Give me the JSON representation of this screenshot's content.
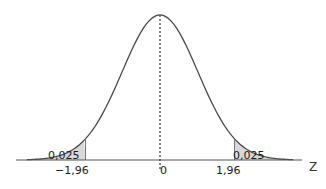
{
  "chart_data": {
    "type": "area",
    "title": "",
    "xlabel": "Z",
    "ylabel": "",
    "distribution": "standard normal",
    "xlim": [
      -3.1,
      3.1
    ],
    "mean": 0,
    "std": 1,
    "critical_values": [
      -1.96,
      1.96
    ],
    "tail_areas": [
      0.025,
      0.025
    ],
    "tick_labels": [
      "-1,96",
      "0",
      "1,96"
    ],
    "area_labels": [
      "0,025",
      "0,025"
    ],
    "annotations": [
      "dotted vertical line at mean 0"
    ],
    "grid": false,
    "legend": null
  },
  "labels": {
    "left_critical": "−1,96",
    "center": "0",
    "right_critical": "1,96",
    "left_area": "0,025",
    "right_area": "0,025",
    "axis": "Z"
  },
  "colors": {
    "curve": "#4a4a4a",
    "shade": "#d8d8d8",
    "axis": "#555555"
  }
}
